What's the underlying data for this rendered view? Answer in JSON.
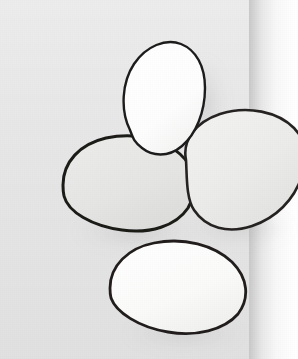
{
  "image": {
    "title": "Four eggs on a gray backdrop",
    "medium": "grayscale illustration",
    "width": 298,
    "height": 359,
    "alt_text": "Four overlapping egg-shaped ovals drawn with dark hand-inked outlines, arranged on a light gray rectangular backdrop that ends before the right edge of the frame"
  },
  "palette": {
    "page_background": "#ffffff",
    "backdrop_gray": "#e4e4e4",
    "outline_dark": "#23211f",
    "outline_soft": "#4a4644",
    "egg_white": "#fcfcfb",
    "egg_light_gray": "#ececeb",
    "egg_mid_gray": "#e3e3e2",
    "shadow_gray": "#b9b9b9"
  },
  "backdrop": {
    "name": "gray panel",
    "left": 0,
    "top": 0,
    "width": 249,
    "height": 359,
    "fill": "#e4e4e4",
    "edge_shadow_width": 46
  },
  "objects": [
    {
      "id": "egg-top",
      "label": "top egg",
      "description": "upright tapered egg, brightest white, pointed toward the upper left",
      "cx": 162,
      "cy": 96,
      "rx": 39,
      "ry": 50,
      "rotation": -18,
      "fill": "#fdfdfd",
      "outline": "#1f1d1c",
      "outline_width": 2.4,
      "z": 3,
      "path": "M 130 130 C 120 110 122 82 134 64 C 146 46 166 38 181 44 C 196 50 205 66 205 88 C 205 112 196 134 182 146 C 168 158 152 156 142 148 C 134 142 133 138 130 130 Z"
    },
    {
      "id": "egg-right",
      "label": "right egg",
      "description": "large oval tilted to the right, extends past the gray panel edge onto the white margin",
      "cx": 232,
      "cy": 175,
      "rx": 66,
      "ry": 49,
      "rotation": -30,
      "fill": "#ededec",
      "outline": "#262422",
      "outline_width": 2.6,
      "z": 2,
      "path": "M 186 160 C 182 140 196 122 220 114 C 248 105 278 112 294 128 C 306 140 309 156 302 176 C 294 200 276 218 252 226 C 228 234 206 228 194 210 C 186 198 187 176 186 160 Z"
    },
    {
      "id": "egg-left",
      "label": "left egg",
      "description": "wide horizontal oval, mid gray fill, thickest inked outline",
      "cx": 130,
      "cy": 185,
      "rx": 67,
      "ry": 45,
      "rotation": -8,
      "fill": "#e6e6e5",
      "outline": "#1c1a19",
      "outline_width": 3.0,
      "z": 1,
      "path": "M 63 185 C 63 162 80 144 106 138 C 134 132 162 138 180 154 C 196 168 198 190 188 208 C 176 226 150 234 122 230 C 92 226 68 212 64 196 C 63 192 63 188 63 185 Z"
    },
    {
      "id": "egg-bottom",
      "label": "bottom egg",
      "description": "wide oval below the others, near-white fill, sits low in the frame",
      "cx": 176,
      "cy": 289,
      "rx": 66,
      "ry": 44,
      "rotation": -6,
      "fill": "#fafaf9",
      "outline": "#201e1d",
      "outline_width": 2.8,
      "z": 0,
      "path": "M 110 288 C 110 266 128 248 154 243 C 184 237 214 245 232 262 C 248 278 250 298 238 314 C 224 330 196 337 168 332 C 138 327 116 312 111 298 C 110 294 110 291 110 288 Z"
    }
  ],
  "shadows": [
    {
      "id": "shadow-top-egg",
      "label": "shadow right of top egg",
      "cx": 204,
      "cy": 104,
      "rx": 20,
      "ry": 46,
      "opacity": 0.26
    },
    {
      "id": "shadow-left-egg",
      "label": "shadow under left egg",
      "cx": 136,
      "cy": 232,
      "rx": 60,
      "ry": 17,
      "opacity": 0.24
    },
    {
      "id": "shadow-right-egg",
      "label": "shadow under right egg",
      "cx": 240,
      "cy": 228,
      "rx": 54,
      "ry": 16,
      "opacity": 0.22
    },
    {
      "id": "shadow-bottom-egg",
      "label": "shadow under bottom egg",
      "cx": 184,
      "cy": 334,
      "rx": 60,
      "ry": 14,
      "opacity": 0.2
    }
  ]
}
